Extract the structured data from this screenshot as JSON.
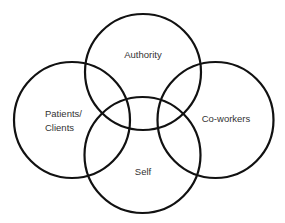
{
  "diagram": {
    "type": "venn",
    "circles": [
      {
        "id": "authority",
        "label": "Authority"
      },
      {
        "id": "patients",
        "label_lines": [
          "Patients/",
          "Clients"
        ]
      },
      {
        "id": "coworkers",
        "label": "Co-workers"
      },
      {
        "id": "self",
        "label": "Self"
      }
    ],
    "stroke_color": "#111111",
    "text_color": "#333333"
  }
}
